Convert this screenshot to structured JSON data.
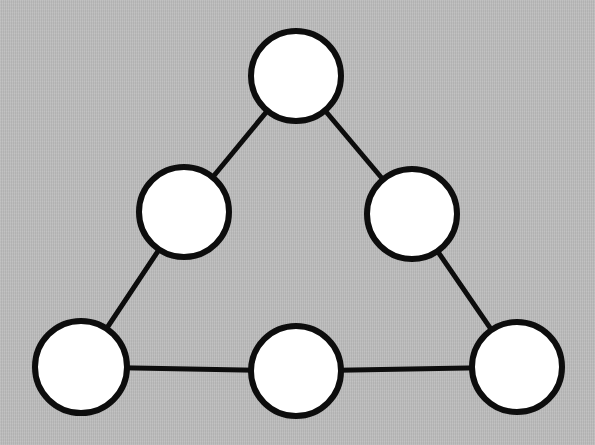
{
  "diagram": {
    "type": "node-link-graph",
    "background_color": "#bdbdbd",
    "node_fill_color": "#ffffff",
    "node_stroke_color": "#0d0d0d",
    "edge_color": "#0d0d0d",
    "node_stroke_width": 6,
    "edge_stroke_width": 5,
    "canvas": {
      "width": 595,
      "height": 445
    },
    "node_count": "6",
    "edge_count": "6",
    "nodes": [
      {
        "id": "top",
        "label": "",
        "cx": 296,
        "cy": 76,
        "r": 45
      },
      {
        "id": "mid-left",
        "label": "",
        "cx": 184,
        "cy": 212,
        "r": 45
      },
      {
        "id": "mid-right",
        "label": "",
        "cx": 412,
        "cy": 214,
        "r": 45
      },
      {
        "id": "bottom-left",
        "label": "",
        "cx": 81,
        "cy": 367,
        "r": 46
      },
      {
        "id": "bottom-center",
        "label": "",
        "cx": 296,
        "cy": 371,
        "r": 45
      },
      {
        "id": "bottom-right",
        "label": "",
        "cx": 517,
        "cy": 367,
        "r": 45
      }
    ],
    "edges": [
      {
        "id": "edge-top-midleft",
        "from": "top",
        "to": "mid-left"
      },
      {
        "id": "edge-top-midright",
        "from": "top",
        "to": "mid-right"
      },
      {
        "id": "edge-midleft-bottomleft",
        "from": "mid-left",
        "to": "bottom-left"
      },
      {
        "id": "edge-midright-bottomright",
        "from": "mid-right",
        "to": "bottom-right"
      },
      {
        "id": "edge-bottomleft-bottomcenter",
        "from": "bottom-left",
        "to": "bottom-center"
      },
      {
        "id": "edge-bottomcenter-bottomright",
        "from": "bottom-center",
        "to": "bottom-right"
      }
    ]
  }
}
